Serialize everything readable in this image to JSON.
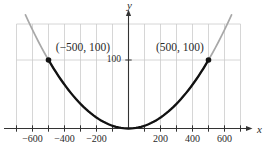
{
  "figure": {
    "background": "#ffffff"
  },
  "chart_data": {
    "type": "line",
    "title": "",
    "xlabel": "x",
    "ylabel": "y",
    "x_window": [
      -700,
      700
    ],
    "y_window": [
      0,
      152
    ],
    "grid": {
      "x_step": 100,
      "y_lines": [
        100
      ],
      "grid_on": true
    },
    "x_tick_values": [
      -700,
      -600,
      -500,
      -400,
      -300,
      -200,
      -100,
      100,
      200,
      300,
      400,
      500,
      600,
      700
    ],
    "x_tick_labels": [
      "−600",
      "−400",
      "−200",
      "200",
      "400",
      "600"
    ],
    "x_labeled_tick_values": [
      -600,
      -400,
      -200,
      200,
      400,
      600
    ],
    "y_tick_values": [
      100
    ],
    "y_tick_label": "100",
    "series": [
      {
        "name": "parabola-full",
        "style": "muted",
        "color": "#a8a8a8",
        "x_range": [
          -644,
          644
        ],
        "width": 1.7
      },
      {
        "name": "parabola-emphasized",
        "style": "emphasis",
        "color": "#121212",
        "x_range": [
          -500,
          500
        ],
        "width": 2.3
      }
    ],
    "curve_points": [
      [
        -600,
        144
      ],
      [
        -500,
        100
      ],
      [
        -400,
        64
      ],
      [
        -300,
        36
      ],
      [
        -200,
        16
      ],
      [
        -100,
        4
      ],
      [
        0,
        0
      ],
      [
        100,
        4
      ],
      [
        200,
        16
      ],
      [
        300,
        36
      ],
      [
        400,
        64
      ],
      [
        500,
        100
      ],
      [
        600,
        144
      ]
    ],
    "marked_points": [
      [
        -500,
        100
      ],
      [
        500,
        100
      ]
    ],
    "annotations": [
      {
        "text": "(−500, 100)",
        "point": [
          -500,
          100
        ]
      },
      {
        "text": "(500, 100)",
        "point": [
          500,
          100
        ]
      }
    ],
    "colors": {
      "grid": "#cccccc",
      "axis": "#333333",
      "curve_emphasis": "#121212",
      "curve_muted": "#a8a8a8",
      "point": "#121212",
      "text": "#2a2a2a"
    }
  }
}
